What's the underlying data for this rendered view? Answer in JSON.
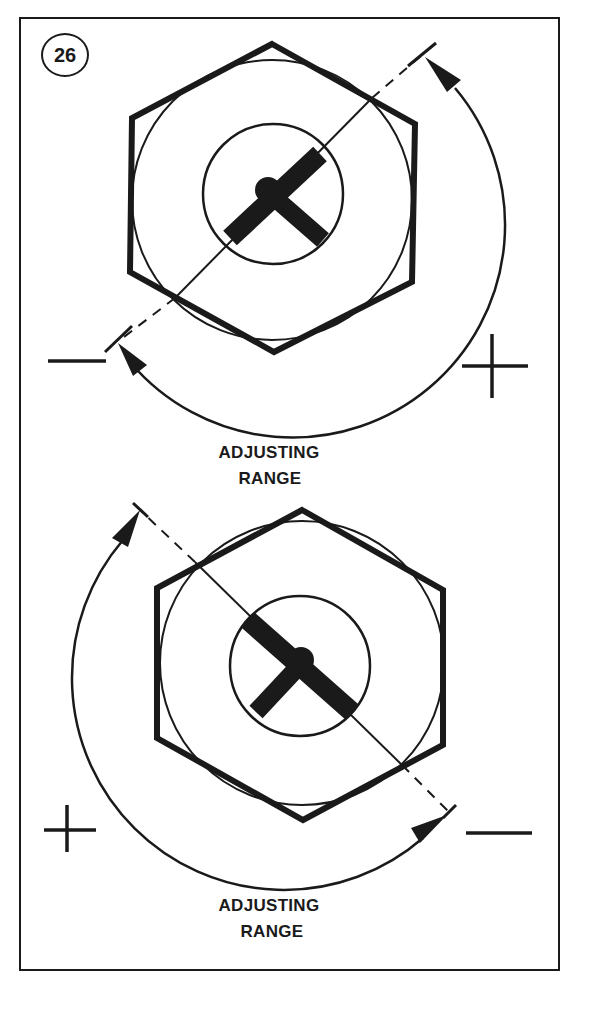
{
  "figure": {
    "number": "26",
    "top_diagram": {
      "label_line1": "ADJUSTING",
      "label_line2": "RANGE",
      "left_sign": "−",
      "right_sign": "+"
    },
    "bottom_diagram": {
      "label_line1": "ADJUSTING",
      "label_line2": "RANGE",
      "left_sign": "+",
      "right_sign": "−"
    }
  },
  "colors": {
    "ink": "#1a1a1a",
    "paper": "#ffffff"
  }
}
